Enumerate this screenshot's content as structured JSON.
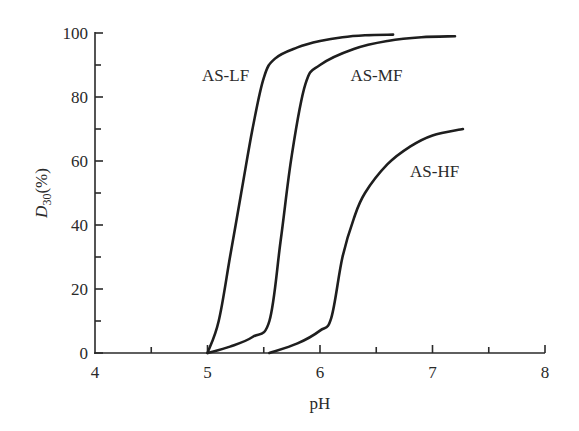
{
  "chart_data": {
    "type": "line",
    "title": "",
    "xlabel": "pH",
    "ylabel": "D30 (%)",
    "ylabel_main": "D",
    "ylabel_sub": "30",
    "ylabel_unit": "(%)",
    "xlim": [
      4,
      8
    ],
    "ylim": [
      0,
      100
    ],
    "grid": false,
    "legend": "inline labels",
    "x_ticks": [
      4,
      5,
      6,
      7,
      8
    ],
    "x_tick_labels": [
      "4",
      "5",
      "6",
      "7",
      "8"
    ],
    "x_minor_ticks": [
      4.5,
      5.5,
      6.5,
      7.5
    ],
    "y_ticks": [
      0,
      20,
      40,
      60,
      80,
      100
    ],
    "y_tick_labels": [
      "0",
      "20",
      "40",
      "60",
      "80",
      "100"
    ],
    "y_minor_ticks": [
      10,
      30,
      50,
      70,
      90
    ],
    "series": [
      {
        "name": "AS-LF",
        "x": [
          5.0,
          5.1,
          5.2,
          5.3,
          5.4,
          5.5,
          5.6,
          5.8,
          6.0,
          6.2,
          6.4,
          6.65
        ],
        "y": [
          0,
          10,
          30,
          50,
          70,
          86,
          92,
          95.5,
          97.5,
          98.7,
          99.3,
          99.5
        ]
      },
      {
        "name": "AS-MF",
        "x": [
          5.0,
          5.2,
          5.4,
          5.55,
          5.65,
          5.75,
          5.87,
          6.0,
          6.3,
          6.6,
          6.9,
          7.2
        ],
        "y": [
          0,
          2,
          5,
          10,
          35,
          62,
          84,
          90,
          95,
          97.5,
          98.7,
          99
        ]
      },
      {
        "name": "AS-HF",
        "x": [
          5.55,
          5.8,
          6.0,
          6.1,
          6.2,
          6.3,
          6.4,
          6.6,
          6.8,
          7.0,
          7.27
        ],
        "y": [
          0,
          3,
          7,
          11,
          30,
          42,
          50,
          59,
          64.5,
          68,
          70
        ]
      }
    ],
    "annotations": [
      {
        "text": "AS-LF",
        "x": 4.95,
        "y": 87
      },
      {
        "text": "AS-MF",
        "x": 6.27,
        "y": 87
      },
      {
        "text": "AS-HF",
        "x": 6.8,
        "y": 57
      }
    ]
  }
}
